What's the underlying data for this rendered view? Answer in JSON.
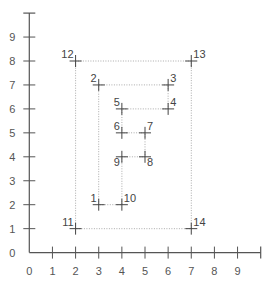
{
  "chart_data": {
    "type": "scatter",
    "title": "",
    "xlabel": "",
    "ylabel": "",
    "xlim": [
      0,
      10
    ],
    "ylim": [
      0,
      10
    ],
    "grid": false,
    "x_ticks": [
      0,
      1,
      2,
      3,
      4,
      5,
      6,
      7,
      8,
      9
    ],
    "y_ticks": [
      0,
      1,
      2,
      3,
      4,
      5,
      6,
      7,
      8,
      9
    ],
    "marker": "plus",
    "points": [
      {
        "label": "1",
        "x": 3,
        "y": 2,
        "label_pos": "ul"
      },
      {
        "label": "2",
        "x": 3,
        "y": 7,
        "label_pos": "ul"
      },
      {
        "label": "3",
        "x": 6,
        "y": 7,
        "label_pos": "ur"
      },
      {
        "label": "4",
        "x": 6,
        "y": 6,
        "label_pos": "ur"
      },
      {
        "label": "5",
        "x": 4,
        "y": 6,
        "label_pos": "ul"
      },
      {
        "label": "6",
        "x": 4,
        "y": 5,
        "label_pos": "ul"
      },
      {
        "label": "7",
        "x": 5,
        "y": 5,
        "label_pos": "ur"
      },
      {
        "label": "8",
        "x": 5,
        "y": 4,
        "label_pos": "lr"
      },
      {
        "label": "9",
        "x": 4,
        "y": 4,
        "label_pos": "ll"
      },
      {
        "label": "10",
        "x": 4,
        "y": 2,
        "label_pos": "ur"
      },
      {
        "label": "11",
        "x": 2,
        "y": 1,
        "label_pos": "ul"
      },
      {
        "label": "12",
        "x": 2,
        "y": 8,
        "label_pos": "ul"
      },
      {
        "label": "13",
        "x": 7,
        "y": 8,
        "label_pos": "ur"
      },
      {
        "label": "14",
        "x": 7,
        "y": 1,
        "label_pos": "ur"
      }
    ],
    "polylines": [
      {
        "name": "inner-F-outline",
        "style": "dotted",
        "closed": true,
        "point_labels": [
          "1",
          "2",
          "3",
          "4",
          "5",
          "6",
          "7",
          "8",
          "9",
          "10"
        ]
      },
      {
        "name": "outer-rectangle",
        "style": "dotted",
        "closed": true,
        "point_labels": [
          "11",
          "12",
          "13",
          "14"
        ]
      }
    ],
    "colors": {
      "axis": "#555555",
      "marker": "#444444",
      "dotted_line": "#aaaaaa",
      "text": "#555555"
    }
  }
}
